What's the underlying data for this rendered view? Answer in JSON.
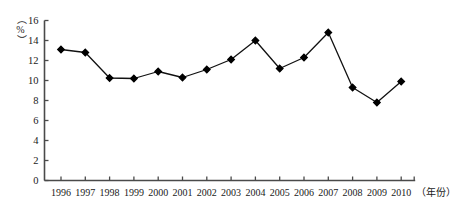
{
  "chart_data": {
    "type": "line",
    "title": "",
    "xlabel": "（年份）",
    "ylabel": "（%）",
    "ylim": [
      0,
      16
    ],
    "ytick_step": 2,
    "grid": false,
    "legend": "none",
    "marker": "diamond",
    "line_color": "#111111",
    "marker_color": "#000000",
    "axis_color": "#4a4a4a",
    "background": "#ffffff",
    "categories": [
      "1996",
      "1997",
      "1998",
      "1999",
      "2000",
      "2001",
      "2002",
      "2003",
      "2004",
      "2005",
      "2006",
      "2007",
      "2008",
      "2009",
      "2010"
    ],
    "values": [
      13.1,
      12.8,
      10.25,
      10.2,
      10.9,
      10.3,
      11.1,
      12.1,
      14.0,
      11.2,
      12.3,
      14.8,
      9.3,
      7.8,
      9.9
    ],
    "ytick_labels": [
      "0",
      "2",
      "4",
      "6",
      "8",
      "10",
      "12",
      "14",
      "16"
    ],
    "xtick_labels": [
      "1996",
      "1997",
      "1998",
      "1999",
      "2000",
      "2001",
      "2002",
      "2003",
      "2004",
      "2005",
      "2006",
      "2007",
      "2008",
      "2009",
      "2010"
    ]
  }
}
